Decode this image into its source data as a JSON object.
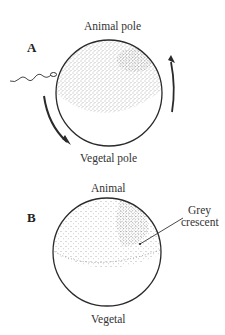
{
  "figure": {
    "panels": [
      {
        "id": "A",
        "label": "A",
        "top_label": "Animal pole",
        "bottom_label": "Vegetal pole",
        "features": [
          "sperm-entry",
          "cortical-rotation-arrows",
          "pigmented-animal-hemisphere"
        ]
      },
      {
        "id": "B",
        "label": "B",
        "top_label": "Animal",
        "bottom_label": "Vegetal",
        "callout": "Grey\ncrescent",
        "callout_line1": "Grey",
        "callout_line2": "crescent",
        "features": [
          "pigmented-animal-hemisphere",
          "grey-crescent"
        ]
      }
    ],
    "colors": {
      "outline": "#2a2a2a",
      "stipple": "#555555",
      "background": "#ffffff"
    }
  }
}
